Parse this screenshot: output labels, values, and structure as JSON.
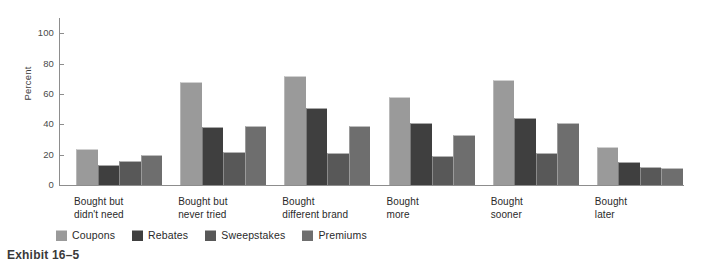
{
  "caption": "Exhibit 16–5",
  "colors": {
    "series": [
      "#9a9a9a",
      "#3f3f3f",
      "#585858",
      "#6e6e6e"
    ],
    "axis": "#8d8d8d",
    "background": "#ffffff",
    "text": "#2a2a2a"
  },
  "legend": {
    "position": "bottom",
    "items": [
      {
        "label": "Coupons",
        "color": "#9a9a9a",
        "swatch_name": "legend-swatch-coupons"
      },
      {
        "label": "Rebates",
        "color": "#3f3f3f",
        "swatch_name": "legend-swatch-rebates"
      },
      {
        "label": "Sweepstakes",
        "color": "#585858",
        "swatch_name": "legend-swatch-sweepstakes"
      },
      {
        "label": "Premiums",
        "color": "#6e6e6e",
        "swatch_name": "legend-swatch-premiums"
      }
    ]
  },
  "chart_data": {
    "type": "bar",
    "title": "",
    "subtitle": "",
    "xlabel": "",
    "ylabel": "Percent",
    "ylim": [
      0,
      110
    ],
    "yticks": [
      0,
      20,
      40,
      60,
      80,
      100
    ],
    "ytick_labels": [
      "0",
      "20",
      "40",
      "60",
      "80",
      "100"
    ],
    "grid": false,
    "legend_position": "bottom",
    "categories": [
      "Bought but\ndidn't need",
      "Bought but\nnever tried",
      "Bought\ndifferent brand",
      "Bought\nmore",
      "Bought\nsooner",
      "Bought\nlater"
    ],
    "series": [
      {
        "name": "Coupons",
        "color": "#9a9a9a",
        "values": [
          24,
          68,
          72,
          58,
          69,
          25
        ]
      },
      {
        "name": "Rebates",
        "color": "#3f3f3f",
        "values": [
          13,
          38,
          51,
          41,
          44,
          15
        ]
      },
      {
        "name": "Sweepstakes",
        "color": "#585858",
        "values": [
          16,
          22,
          21,
          19,
          21,
          12
        ]
      },
      {
        "name": "Premiums",
        "color": "#6e6e6e",
        "values": [
          20,
          39,
          39,
          33,
          41,
          11
        ]
      }
    ]
  }
}
